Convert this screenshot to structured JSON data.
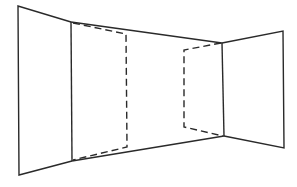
{
  "diagram": {
    "line_color": "#2a2a2a",
    "background": "#ffffff",
    "elements": [
      {
        "name": "left-wall-panel",
        "style": "solid"
      },
      {
        "name": "left-inner-edge",
        "style": "solid"
      },
      {
        "name": "ceiling-line",
        "style": "solid"
      },
      {
        "name": "floor-line",
        "style": "solid"
      },
      {
        "name": "left-dashed-panel",
        "style": "dashed"
      },
      {
        "name": "right-dashed-panel",
        "style": "dashed"
      },
      {
        "name": "right-inner-edge",
        "style": "solid"
      },
      {
        "name": "right-wall-panel",
        "style": "solid"
      }
    ]
  }
}
